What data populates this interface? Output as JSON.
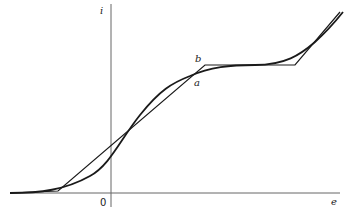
{
  "diagram": {
    "type": "characteristic-curve",
    "axes": {
      "vertical_label": "i",
      "horizontal_label": "e",
      "origin_label": "0"
    },
    "curves": [
      {
        "label": "a",
        "kind": "smooth-curve",
        "description": "S-shaped curve crossing the piecewise-linear approximation"
      },
      {
        "label": "b",
        "kind": "piecewise-linear",
        "description": "Piecewise-linear approximation of curve a"
      }
    ],
    "colors": {
      "stroke": "#1a1a1a",
      "axis": "#555555",
      "background": "#ffffff"
    }
  }
}
